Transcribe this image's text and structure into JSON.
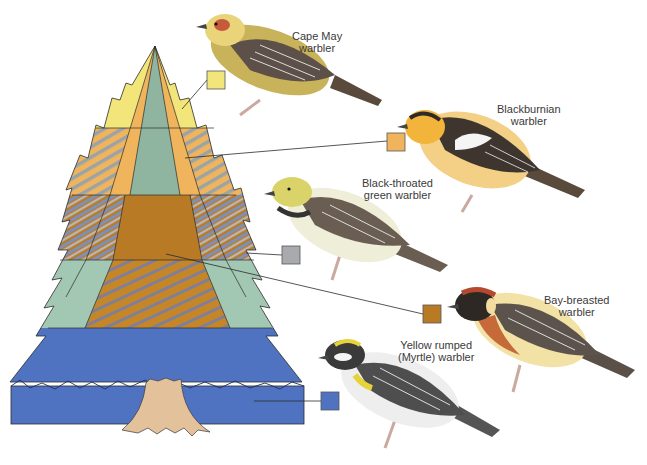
{
  "diagram": {
    "colors": {
      "cape_may": "#f2e57a",
      "blackburnian": "#f0b55c",
      "black_throated_green": "#9aa3a8",
      "bay_breasted": "#b97a26",
      "yellow_rumped": "#4f73c0",
      "tree_core": "#8fb5a1",
      "trunk": "#e3c19a",
      "outline": "#2b2b2b"
    },
    "species": [
      {
        "id": "cape-may",
        "line1": "Cape May",
        "line2": "warbler",
        "swatch": "#f2e57a",
        "zone": "top outer branches"
      },
      {
        "id": "blackburnian",
        "line1": "Blackburnian",
        "line2": "warbler",
        "swatch": "#f0b55c",
        "zone": "upper outer band"
      },
      {
        "id": "black-throated-green",
        "line1": "Black-throated",
        "line2": "green warbler",
        "swatch": "#9aa3a8",
        "zone": "middle outer branches"
      },
      {
        "id": "bay-breasted",
        "line1": "Bay-breasted",
        "line2": "warbler",
        "swatch": "#b97a26",
        "zone": "middle interior"
      },
      {
        "id": "yellow-rumped",
        "line1": "Yellow rumped",
        "line2": "(Myrtle) warbler",
        "swatch": "#4f73c0",
        "zone": "lower tree and ground"
      }
    ]
  }
}
